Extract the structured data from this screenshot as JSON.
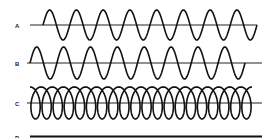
{
  "diagram": {
    "type": "waveform-comparison",
    "traces": [
      {
        "label": "A",
        "description": "sine wave, starts at baseline going up",
        "cycles": 8,
        "baseline_y": 25,
        "amplitude": 15,
        "x_start": 43,
        "x_end": 257
      },
      {
        "label": "B",
        "description": "sine wave, same frequency as A, starts with positive hump",
        "cycles": 8,
        "baseline_y": 63,
        "amplitude": 16,
        "x_start": 30,
        "x_end": 245
      },
      {
        "label": "C",
        "description": "overlapping loops (looped/prolate cycloid-like trace)",
        "loops": 20,
        "baseline_y": 103,
        "amplitude": 16,
        "x_start": 30,
        "x_end": 252
      },
      {
        "label": "D",
        "description": "flat line, no oscillation",
        "baseline_y": 136
      }
    ],
    "colors": {
      "stroke": "#111111",
      "background": "#ffffff"
    }
  }
}
